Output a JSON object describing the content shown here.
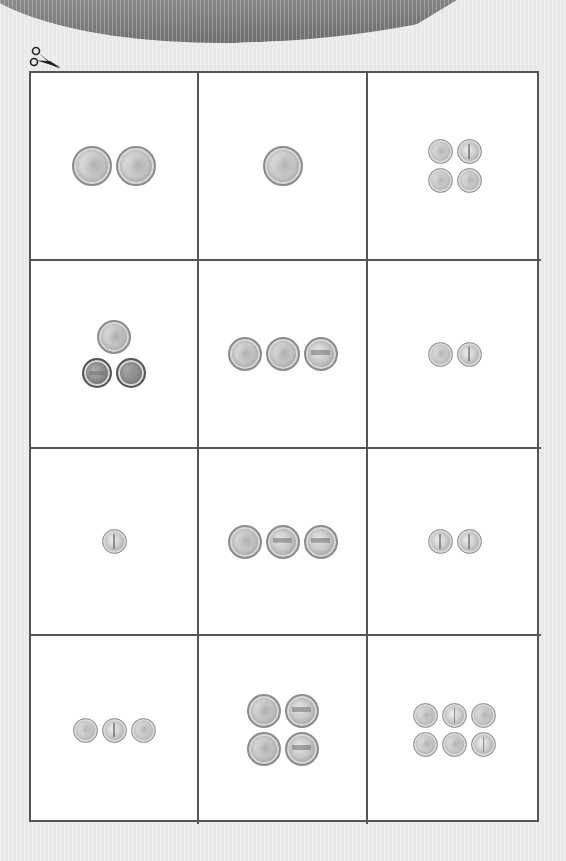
{
  "worksheet": {
    "cut_icon": "scissors-icon",
    "border_color": "#555555",
    "background_color": "#e9e9e9",
    "card_color": "#ffffff",
    "cards": [
      {
        "row": 1,
        "col": 1,
        "rows": [
          [
            {
              "type": "quarter",
              "side": "heads"
            },
            {
              "type": "quarter",
              "side": "heads"
            }
          ]
        ]
      },
      {
        "row": 1,
        "col": 2,
        "rows": [
          [
            {
              "type": "quarter",
              "side": "heads"
            }
          ]
        ]
      },
      {
        "row": 1,
        "col": 3,
        "rows": [
          [
            {
              "type": "dime",
              "side": "heads"
            },
            {
              "type": "dime",
              "side": "tails"
            }
          ],
          [
            {
              "type": "dime",
              "side": "heads"
            },
            {
              "type": "dime",
              "side": "heads"
            }
          ]
        ]
      },
      {
        "row": 2,
        "col": 1,
        "rows": [
          [
            {
              "type": "nickel",
              "side": "heads"
            }
          ],
          [
            {
              "type": "penny",
              "side": "tails"
            },
            {
              "type": "penny",
              "side": "heads"
            }
          ]
        ]
      },
      {
        "row": 2,
        "col": 2,
        "rows": [
          [
            {
              "type": "nickel",
              "side": "heads"
            },
            {
              "type": "nickel",
              "side": "heads"
            },
            {
              "type": "nickel",
              "side": "tails"
            }
          ]
        ]
      },
      {
        "row": 2,
        "col": 3,
        "rows": [
          [
            {
              "type": "dime",
              "side": "heads"
            },
            {
              "type": "dime",
              "side": "tails"
            }
          ]
        ]
      },
      {
        "row": 3,
        "col": 1,
        "rows": [
          [
            {
              "type": "dime",
              "side": "tails"
            }
          ]
        ]
      },
      {
        "row": 3,
        "col": 2,
        "rows": [
          [
            {
              "type": "nickel",
              "side": "heads"
            },
            {
              "type": "nickel",
              "side": "tails"
            },
            {
              "type": "nickel",
              "side": "tails"
            }
          ]
        ]
      },
      {
        "row": 3,
        "col": 3,
        "rows": [
          [
            {
              "type": "dime",
              "side": "tails"
            },
            {
              "type": "dime",
              "side": "tails"
            }
          ]
        ]
      },
      {
        "row": 4,
        "col": 1,
        "rows": [
          [
            {
              "type": "dime",
              "side": "heads"
            },
            {
              "type": "dime",
              "side": "tails"
            },
            {
              "type": "dime",
              "side": "heads"
            }
          ]
        ]
      },
      {
        "row": 4,
        "col": 2,
        "rows": [
          [
            {
              "type": "nickel",
              "side": "heads"
            },
            {
              "type": "nickel",
              "side": "tails"
            }
          ],
          [
            {
              "type": "nickel",
              "side": "heads"
            },
            {
              "type": "nickel",
              "side": "tails"
            }
          ]
        ]
      },
      {
        "row": 4,
        "col": 3,
        "rows": [
          [
            {
              "type": "dime",
              "side": "heads"
            },
            {
              "type": "dime",
              "side": "tails"
            },
            {
              "type": "dime",
              "side": "heads"
            }
          ],
          [
            {
              "type": "dime",
              "side": "heads"
            },
            {
              "type": "dime",
              "side": "heads"
            },
            {
              "type": "dime",
              "side": "tails"
            }
          ]
        ]
      }
    ]
  }
}
